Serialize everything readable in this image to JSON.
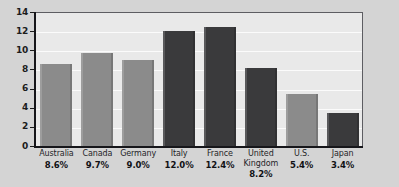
{
  "chart_data": {
    "type": "bar",
    "title": "",
    "subtitle": "",
    "xlabel": "",
    "ylabel": "",
    "ylim": [
      0,
      14
    ],
    "ytick_values": [
      0,
      2,
      4,
      6,
      8,
      10,
      12,
      14
    ],
    "ytick_labels": [
      "0",
      "2",
      "4",
      "6",
      "8",
      "10",
      "12",
      "14"
    ],
    "grid": "horizontal",
    "legend": "none",
    "categories": [
      "Australia",
      "Canada",
      "Germany",
      "Italy",
      "France",
      "United Kingdom",
      "U.S.",
      "Japan"
    ],
    "values": [
      8.6,
      9.7,
      9.0,
      12.0,
      12.4,
      8.2,
      5.4,
      3.4
    ],
    "value_labels": [
      "8.6%",
      "9.7%",
      "9.0%",
      "12.0%",
      "12.4%",
      "8.2%",
      "5.4%",
      "3.4%"
    ],
    "bar_shades": [
      "light",
      "light",
      "light",
      "dark",
      "dark",
      "dark",
      "light",
      "dark"
    ],
    "bars": [
      {
        "category": "Australia",
        "category_display": "Australia",
        "value": 8.6,
        "value_label": "8.6%",
        "shade": "light"
      },
      {
        "category": "Canada",
        "category_display": "Canada",
        "value": 9.7,
        "value_label": "9.7%",
        "shade": "light"
      },
      {
        "category": "Germany",
        "category_display": "Germany",
        "value": 9.0,
        "value_label": "9.0%",
        "shade": "light"
      },
      {
        "category": "Italy",
        "category_display": "Italy",
        "value": 12.0,
        "value_label": "12.0%",
        "shade": "dark"
      },
      {
        "category": "France",
        "category_display": "France",
        "value": 12.4,
        "value_label": "12.4%",
        "shade": "dark"
      },
      {
        "category": "United Kingdom",
        "category_display": "United\nKingdom",
        "value": 8.2,
        "value_label": "8.2%",
        "shade": "dark"
      },
      {
        "category": "U.S.",
        "category_display": "U.S.",
        "value": 5.4,
        "value_label": "5.4%",
        "shade": "light"
      },
      {
        "category": "Japan",
        "category_display": "Japan",
        "value": 3.4,
        "value_label": "3.4%",
        "shade": "dark"
      }
    ]
  },
  "colors": {
    "page_background": "#d4d4d4",
    "plot_background": "#e9e9e9",
    "gridline": "#fbfbfb",
    "axis_line": "#16161a",
    "plot_border": "#5d5d62",
    "bar_light": "#8b8b8b",
    "bar_dark": "#3a3a3c",
    "tick_label": "#1c1c1c",
    "category_label": "#242428",
    "value_label": "#111114"
  }
}
